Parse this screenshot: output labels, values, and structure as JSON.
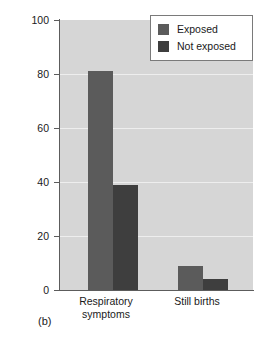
{
  "figure": {
    "panel_label": "(b)"
  },
  "legend": {
    "position": "top-right",
    "entries": [
      {
        "label": "Exposed",
        "color": "#5b5b5b"
      },
      {
        "label": "Not exposed",
        "color": "#3e3e3e"
      }
    ]
  },
  "axes": {
    "ylabel": "Frequency (percent)",
    "xlabel": "",
    "yticks": [
      "100",
      "80",
      "60",
      "40",
      "20",
      "0"
    ],
    "xtick_labels": [
      "Respiratory\nsymptoms",
      "Still births"
    ]
  },
  "chart_data": {
    "type": "bar",
    "title": "",
    "subtitle": "",
    "xlabel": "",
    "ylabel": "Frequency (percent)",
    "ylim": [
      0,
      100
    ],
    "yticks": [
      0,
      20,
      40,
      60,
      80,
      100
    ],
    "grid": true,
    "legend_position": "top-right",
    "annotations": [
      "(b)"
    ],
    "categories": [
      "Respiratory symptoms",
      "Still births"
    ],
    "series": [
      {
        "name": "Exposed",
        "color": "#5b5b5b",
        "values": [
          81,
          9
        ]
      },
      {
        "name": "Not exposed",
        "color": "#3e3e3e",
        "values": [
          39,
          4
        ]
      }
    ]
  },
  "colors": {
    "plot_background": "#d6d6d6",
    "gridline": "#eeeeee",
    "axis": "#5c5c5c",
    "text": "#1a1a1a",
    "legend_background": "#ffffff",
    "legend_border": "#7a7a7a"
  }
}
